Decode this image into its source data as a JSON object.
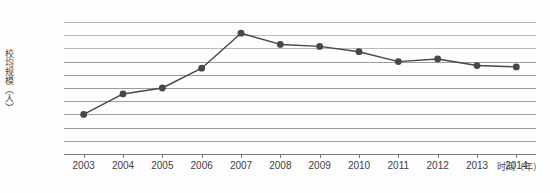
{
  "chart_data": {
    "type": "line",
    "title": "",
    "xlabel": "时间（年）",
    "ylabel": "校均规模（人）",
    "x": [
      2003,
      2004,
      2005,
      2006,
      2007,
      2008,
      2009,
      2010,
      2011,
      2012,
      2013,
      2014
    ],
    "categories": [
      "2003",
      "2004",
      "2005",
      "2006",
      "2007",
      "2008",
      "2009",
      "2010",
      "2011",
      "2012",
      "2013",
      "2014"
    ],
    "values": [
      3000,
      3310,
      3400,
      3700,
      4230,
      4060,
      4030,
      3950,
      3800,
      3840,
      3740,
      3720
    ],
    "series": [
      {
        "name": "校均规模（人）",
        "values": [
          3000,
          3310,
          3400,
          3700,
          4230,
          4060,
          4030,
          3950,
          3800,
          3840,
          3740,
          3720
        ]
      }
    ],
    "ylim": [
      2400,
      4400
    ],
    "ytick_step": 200,
    "yticks": [
      4400,
      4200,
      4000,
      3800,
      3600,
      3400,
      3200,
      3000,
      2800,
      2600,
      2400
    ],
    "ytick_labels": [
      "4400",
      "4200",
      "4000",
      "3800",
      "3600",
      "3400",
      "3200",
      "3000",
      "2800",
      "2600",
      "2400"
    ],
    "xlim": [
      2002.5,
      2014.7
    ],
    "grid": true,
    "grid_axis": "y",
    "legend": false,
    "legend_position": "none",
    "marker": "circle",
    "marker_color": "#474747",
    "line_color": "#474747",
    "grid_color": "#9d9d9d",
    "background": "#fdfdfd"
  }
}
